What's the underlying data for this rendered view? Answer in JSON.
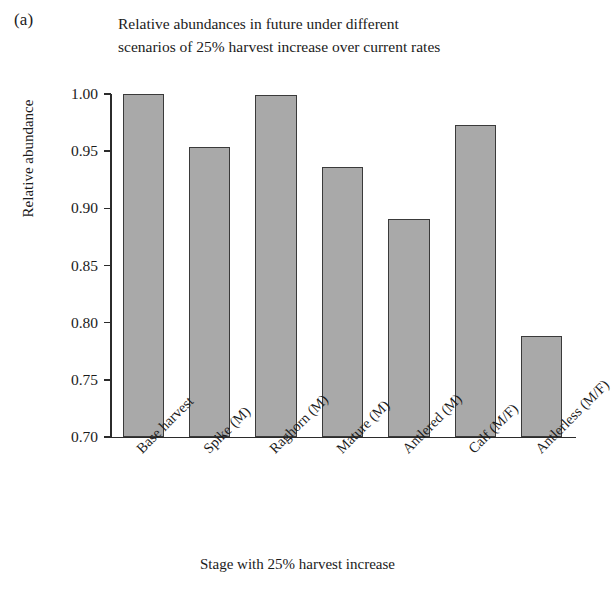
{
  "panel": {
    "label": "(a)"
  },
  "chart_data": {
    "type": "bar",
    "title": "Relative abundances in future under different scenarios of 25% harvest increase over current rates",
    "title_lines": [
      "Relative abundances in future under different",
      "scenarios of 25% harvest increase over current rates"
    ],
    "xlabel": "Stage with 25% harvest increase",
    "ylabel": "Relative abundance",
    "categories": [
      "Base harvest",
      "Spike (M)",
      "Raghorn (M)",
      "Mature (M)",
      "Antlered (M)",
      "Calf (M/F)",
      "Antlerless (M/F)"
    ],
    "values": [
      1.001,
      0.954,
      0.999,
      0.936,
      0.891,
      0.973,
      0.788
    ],
    "ylim": [
      0.7,
      1.0
    ],
    "yticks": [
      1.0,
      0.95,
      0.9,
      0.85,
      0.8,
      0.75,
      0.7
    ],
    "ytick_labels": [
      "1.00",
      "0.95",
      "0.90",
      "0.85",
      "0.80",
      "0.75",
      "0.70"
    ],
    "grid": false,
    "legend": null,
    "bar_color": "#a9a9a9",
    "bar_edge_color": "#3a3a3a",
    "axis_color": "#2b2b2b",
    "xtick_rotation_deg": -45
  }
}
